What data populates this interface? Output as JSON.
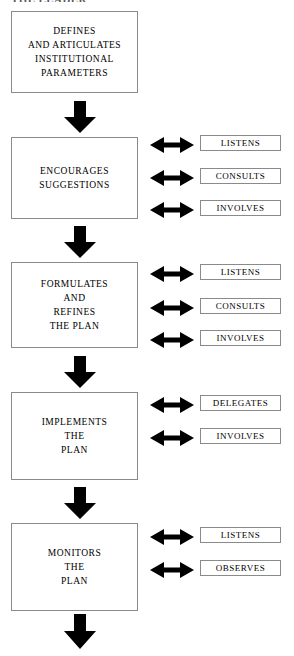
{
  "figure": {
    "clipped_heading": "THE LEADER",
    "accent_color": "#000000",
    "box_border_color": "#8a8a8a",
    "background_color": "#ffffff"
  },
  "stages": [
    {
      "id": "defines",
      "text": "DEFINES\nAND ARTICULATES\nINSTITUTIONAL\nPARAMETERS",
      "labels": []
    },
    {
      "id": "encourages",
      "text": "ENCOURAGES\nSUGGESTIONS",
      "labels": [
        "LISTENS",
        "CONSULTS",
        "INVOLVES"
      ]
    },
    {
      "id": "formulates",
      "text": "FORMULATES\nAND\nREFINES\nTHE PLAN",
      "labels": [
        "LISTENS",
        "CONSULTS",
        "INVOLVES"
      ]
    },
    {
      "id": "implements",
      "text": "IMPLEMENTS\nTHE\nPLAN",
      "labels": [
        "DELEGATES",
        "INVOLVES"
      ]
    },
    {
      "id": "monitors",
      "text": "MONITORS\nTHE\nPLAN",
      "labels": [
        "LISTENS",
        "OBSERVES"
      ]
    }
  ],
  "connectors": {
    "down_arrow_count": 5,
    "double_arrow_count": 10,
    "down_arrow_name": "flow-down-arrow",
    "double_arrow_name": "bidirectional-arrow"
  }
}
